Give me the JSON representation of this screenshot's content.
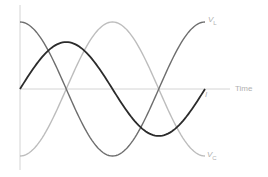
{
  "chart_data": {
    "type": "line",
    "title": "",
    "xlabel": "Time",
    "ylabel": "",
    "grid": false,
    "legend": "inline labels at right end of curves",
    "x_unit": "phase (periods)",
    "x": [
      0,
      0.25,
      0.5,
      0.75,
      1.0
    ],
    "series": [
      {
        "name": "I",
        "label": "I",
        "shape": "sine",
        "amplitude": 0.7,
        "phase_deg": 0,
        "color": "#2b2b2b",
        "values": [
          0,
          0.7,
          0,
          -0.7,
          0
        ]
      },
      {
        "name": "V_L",
        "label": "V",
        "subscript": "L",
        "shape": "cosine",
        "amplitude": 1.0,
        "phase_deg": 90,
        "color": "#6e6e6e",
        "values": [
          1,
          0,
          -1,
          0,
          1
        ]
      },
      {
        "name": "V_C",
        "label": "V",
        "subscript": "C",
        "shape": "negative cosine",
        "amplitude": 1.0,
        "phase_deg": -90,
        "color": "#bdbdbd",
        "values": [
          -1,
          0,
          1,
          0,
          -1
        ]
      }
    ],
    "ylim": [
      -1.2,
      1.2
    ]
  },
  "labels": {
    "time": "Time",
    "current": "I",
    "vl_main": "V",
    "vl_sub": "L",
    "vc_main": "V",
    "vc_sub": "C"
  },
  "colors": {
    "axis": "#d4d4d4",
    "current": "#2b2b2b",
    "vl": "#6e6e6e",
    "vc": "#bdbdbd",
    "label": "#b0b0b0"
  }
}
